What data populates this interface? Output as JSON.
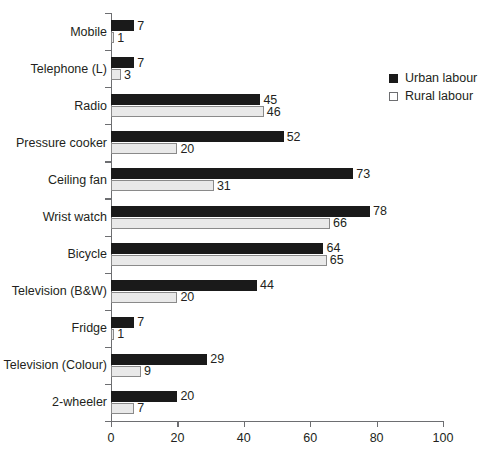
{
  "chart_data": {
    "type": "bar",
    "orientation": "horizontal",
    "title": "",
    "xlabel": "",
    "ylabel": "",
    "xlim": [
      0,
      100
    ],
    "xticks": [
      0,
      20,
      40,
      60,
      80,
      100
    ],
    "grid": false,
    "legend_position": "upper-right",
    "categories": [
      "Mobile",
      "Telephone (L)",
      "Radio",
      "Pressure cooker",
      "Ceiling fan",
      "Wrist watch",
      "Bicycle",
      "Television (B&W)",
      "Fridge",
      "Television (Colour)",
      "2-wheeler"
    ],
    "series": [
      {
        "name": "Urban labour",
        "color": "#1a1a1a",
        "values": [
          7,
          7,
          45,
          52,
          73,
          78,
          64,
          44,
          7,
          29,
          20
        ]
      },
      {
        "name": "Rural labour",
        "color": "#e9e9e9",
        "values": [
          1,
          3,
          46,
          20,
          31,
          66,
          65,
          20,
          1,
          9,
          7
        ]
      }
    ]
  },
  "legend": {
    "items": [
      {
        "label": "Urban labour",
        "swatch": "filled-square-icon"
      },
      {
        "label": "Rural labour",
        "swatch": "open-square-icon"
      }
    ]
  },
  "colors": {
    "urban": "#1a1a1a",
    "rural_fill": "#e9e9e9",
    "rural_border": "#8a8a8a",
    "axis": "#6d6e71",
    "text": "#231f20",
    "background": "#ffffff"
  }
}
